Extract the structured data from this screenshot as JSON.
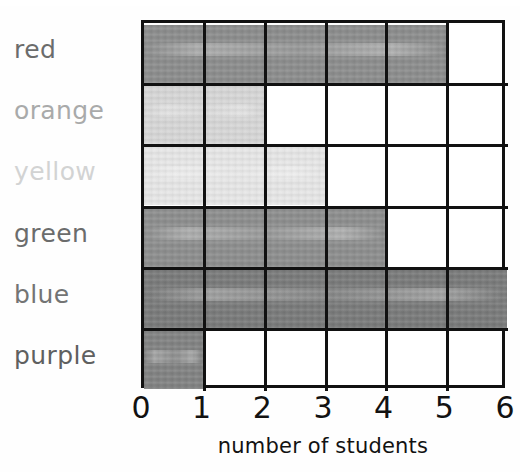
{
  "chart_data": {
    "type": "bar",
    "orientation": "horizontal",
    "title": "",
    "xlabel": "number of students",
    "ylabel": "",
    "categories": [
      "red",
      "orange",
      "yellow",
      "green",
      "blue",
      "purple"
    ],
    "values": [
      5,
      2,
      3,
      4,
      6,
      1
    ],
    "xlim": [
      0,
      6
    ],
    "xticks": [
      "0",
      "1",
      "2",
      "3",
      "4",
      "5",
      "6"
    ],
    "grid": true,
    "legend": "none",
    "series": [
      {
        "name": "number of students",
        "values": [
          5,
          2,
          3,
          4,
          6,
          1
        ]
      }
    ],
    "bar_colors": [
      "#8b8c8c",
      "#d7d7d7",
      "#e7e7e7",
      "#8c8d8d",
      "#787979",
      "#808181"
    ],
    "label_colors": [
      "#6b6c6c",
      "#a9aaaa",
      "#d2d3d3",
      "#6b6c6c",
      "#737474",
      "#5f6060"
    ],
    "grid_line_color": "#111111",
    "plot_background": "#ffffff"
  }
}
